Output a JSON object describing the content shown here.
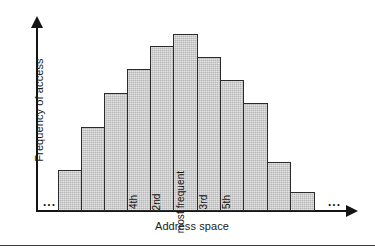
{
  "chart_data": {
    "type": "bar",
    "title": "",
    "xlabel": "Address space",
    "ylabel": "Frequency of access",
    "grid": false,
    "legend": null,
    "axis_arrows": true,
    "xlim_note": "Address space continues beyond plotted range on both sides",
    "ylim": [
      0,
      100
    ],
    "categories": [
      "b1",
      "b2",
      "b3",
      "b4",
      "b5",
      "b6",
      "b7",
      "b8",
      "b9",
      "b10",
      "b11"
    ],
    "values": [
      22,
      46,
      64,
      77,
      90,
      96,
      84,
      71,
      59,
      27,
      11
    ],
    "bar_labels": [
      "",
      "",
      "",
      "4th",
      "2nd",
      "most frequent",
      "3rd",
      "5th",
      "",
      "",
      ""
    ],
    "annotations": {
      "left_ellipsis": "...",
      "right_ellipsis": "..."
    },
    "bar_fill_color": "#c9c9c9",
    "bar_border_color": "#2b2b2b",
    "axis_color": "#141414"
  },
  "bars": [
    {
      "name": "bar-1",
      "label": "",
      "left": 58,
      "width": 24,
      "top": 170,
      "height": 41
    },
    {
      "name": "bar-2",
      "label": "",
      "left": 81,
      "width": 24,
      "top": 127,
      "height": 84
    },
    {
      "name": "bar-3",
      "label": "",
      "left": 104,
      "width": 24,
      "top": 93,
      "height": 118
    },
    {
      "name": "bar-4",
      "label": "4th",
      "left": 127,
      "width": 24,
      "top": 69,
      "height": 142
    },
    {
      "name": "bar-5",
      "label": "2nd",
      "left": 150,
      "width": 24,
      "top": 46,
      "height": 165
    },
    {
      "name": "bar-6",
      "label": "most frequent",
      "left": 173,
      "width": 25,
      "top": 34,
      "height": 177
    },
    {
      "name": "bar-7",
      "label": "3rd",
      "left": 197,
      "width": 24,
      "top": 57,
      "height": 154
    },
    {
      "name": "bar-8",
      "label": "5th",
      "left": 220,
      "width": 24,
      "top": 80,
      "height": 131
    },
    {
      "name": "bar-9",
      "label": "",
      "left": 243,
      "width": 25,
      "top": 103,
      "height": 108
    },
    {
      "name": "bar-10",
      "label": "",
      "left": 267,
      "width": 24,
      "top": 162,
      "height": 49
    },
    {
      "name": "bar-11",
      "label": "",
      "left": 290,
      "width": 25,
      "top": 192,
      "height": 19
    }
  ]
}
